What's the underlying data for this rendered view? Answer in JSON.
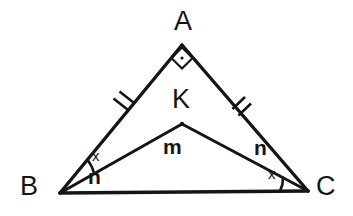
{
  "figure": {
    "type": "geometry-diagram",
    "background_color": "#ffffff",
    "stroke_color": "#151515"
  },
  "vertices": [
    {
      "id": "A",
      "label": "A",
      "x": 182,
      "y": 45,
      "label_x": 174,
      "label_y": 8
    },
    {
      "id": "B",
      "label": "B",
      "x": 60,
      "y": 193,
      "label_x": 20,
      "label_y": 173
    },
    {
      "id": "C",
      "label": "C",
      "x": 308,
      "y": 191,
      "label_x": 316,
      "label_y": 173
    },
    {
      "id": "K",
      "label": "K",
      "x": 182,
      "y": 124,
      "label_x": 172,
      "label_y": 86
    }
  ],
  "segments": [
    {
      "name": "AB",
      "from": "A",
      "to": "B",
      "ticks": 2
    },
    {
      "name": "AC",
      "from": "A",
      "to": "C",
      "ticks": 2
    },
    {
      "name": "BC",
      "from": "B",
      "to": "C",
      "ticks": 0
    },
    {
      "name": "BK",
      "from": "B",
      "to": "K",
      "ticks": 0
    },
    {
      "name": "KC",
      "from": "K",
      "to": "C",
      "ticks": 0
    }
  ],
  "markers": {
    "right_angle": {
      "at": "A",
      "symbol": "square-with-dot",
      "label": ""
    },
    "congruent_ticks": {
      "segments": [
        "AB",
        "AC"
      ],
      "count": 2
    },
    "angle_arcs": [
      {
        "at": "B",
        "between": [
          "BA",
          "BK"
        ],
        "label": "x"
      },
      {
        "at": "C",
        "between": [
          "CK",
          "CB"
        ],
        "label": "x"
      }
    ]
  },
  "angle_labels": [
    {
      "id": "angle-x-at-b",
      "text": "x",
      "style": "plain",
      "x": 92,
      "y": 148
    },
    {
      "id": "angle-n-at-b",
      "text": "n",
      "style": "bold",
      "x": 88,
      "y": 166
    },
    {
      "id": "angle-m-at-k",
      "text": "m",
      "style": "bold",
      "x": 163,
      "y": 136
    },
    {
      "id": "angle-n-at-c",
      "text": "n",
      "style": "bold",
      "x": 254,
      "y": 137
    },
    {
      "id": "angle-x-at-c",
      "text": "x",
      "style": "plain",
      "x": 268,
      "y": 166
    }
  ]
}
